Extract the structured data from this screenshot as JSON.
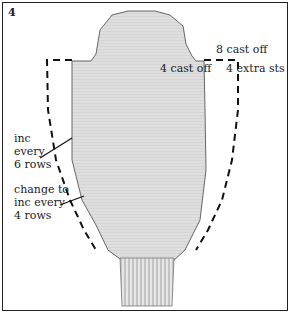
{
  "figure": {
    "number": "4",
    "labels": {
      "cast_off_8": "8 cast off",
      "cast_off_4": "4 cast off",
      "extra_sts": "4 extra sts",
      "inc_every_6_line1": "inc",
      "inc_every_6_line2": "every",
      "inc_every_6_line3": "6 rows",
      "change_line1": "change to",
      "change_line2": "inc every",
      "change_line3": "4 rows"
    },
    "colors": {
      "fabric": "#dcdcdc",
      "outline": "#555555",
      "dashed": "#111111",
      "frame": "#222222"
    }
  }
}
